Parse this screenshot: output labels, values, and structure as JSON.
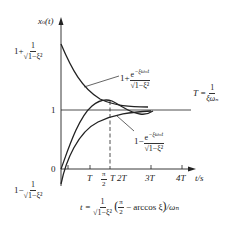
{
  "diagram": {
    "type": "second-order underdamped step response with envelope curves",
    "y_axis": {
      "label": "x",
      "label_sub": "o",
      "label_arg": "(t)"
    },
    "x_axis": {
      "label": "t/s"
    },
    "y_ticks": [
      {
        "id": "upper",
        "prefix": "1+",
        "num": "1",
        "den": "√1−ξ²"
      },
      {
        "id": "one",
        "text": "1"
      },
      {
        "id": "zero",
        "text": "0"
      },
      {
        "id": "lower",
        "prefix": "1−",
        "num": "1",
        "den": "√1−ξ²"
      }
    ],
    "x_ticks": [
      "T",
      "π/2",
      "T",
      "2T",
      "3T",
      "4T"
    ],
    "x_ticks_labels": {
      "T": "T",
      "pi_num": "π",
      "pi_den": "2",
      "pi_T": "T",
      "two_T": "2T",
      "three_T": "3T",
      "four_T": "4T"
    },
    "upper_envelope_label": {
      "prefix": "1+",
      "num": "e",
      "num_exp": "−ξωₙt",
      "den": "√1−ξ²"
    },
    "lower_envelope_label": {
      "prefix": "1−",
      "num": "e",
      "num_exp": "−ξωₙt",
      "den": "√1−ξ²"
    },
    "time_constant": {
      "lhs": "T =",
      "num": "1",
      "den": "ξωₙ"
    },
    "peak_time_formula": {
      "lhs": "t =",
      "num": "1",
      "den": "√1−ξ²",
      "paren_open": "(",
      "pi_num": "π",
      "pi_den": "2",
      "rest": "− arccos ξ",
      "paren_close": ")",
      "tail": "/ωₙ"
    },
    "colors": {
      "stroke": "#222222",
      "background": "#ffffff"
    }
  }
}
